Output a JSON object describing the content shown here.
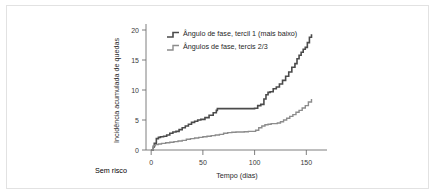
{
  "figure": {
    "caption_left": "Sem risco",
    "border_color": "#e2e2e2",
    "background": "#ffffff"
  },
  "chart_data": {
    "type": "line",
    "subtype": "step",
    "title": "",
    "xlabel": "Tempo (dias)",
    "ylabel": "Incidência acumulada de quedas",
    "xlim": [
      -5,
      170
    ],
    "ylim": [
      0,
      21
    ],
    "xticks": [
      0,
      50,
      100,
      150
    ],
    "yticks": [
      0,
      5,
      10,
      15,
      20
    ],
    "grid": false,
    "legend_position": "top-left",
    "axis_color": "#6f6f6f",
    "series": [
      {
        "name": "Ângulo de fase, tercil 1 (mais baixo)",
        "color": "#4b4b4b",
        "width": 1.6,
        "x": [
          0,
          2,
          3,
          5,
          7,
          9,
          12,
          15,
          18,
          21,
          24,
          27,
          30,
          33,
          36,
          39,
          42,
          45,
          48,
          52,
          56,
          60,
          63,
          64,
          66,
          70,
          78,
          86,
          94,
          100,
          103,
          106,
          109,
          111,
          113,
          115,
          118,
          121,
          124,
          127,
          130,
          133,
          136,
          139,
          141,
          143,
          145,
          147,
          149,
          151,
          153,
          155
        ],
        "y": [
          0.0,
          0.5,
          1.1,
          1.9,
          2.1,
          2.2,
          2.3,
          2.5,
          2.8,
          3.0,
          3.1,
          3.4,
          3.7,
          4.0,
          4.3,
          4.6,
          4.8,
          5.0,
          5.1,
          5.4,
          5.8,
          6.2,
          6.6,
          6.9,
          6.9,
          6.9,
          6.9,
          6.9,
          6.9,
          6.95,
          7.4,
          7.6,
          8.5,
          9.2,
          9.6,
          9.7,
          10.2,
          10.5,
          11.0,
          11.6,
          12.3,
          13.0,
          13.8,
          14.4,
          15.2,
          15.8,
          16.3,
          16.8,
          17.1,
          17.9,
          18.8,
          19.3
        ]
      },
      {
        "name": "Ângulos de fase, tercis 2/3",
        "color": "#8c8c8c",
        "width": 1.4,
        "x": [
          0,
          2,
          4,
          7,
          10,
          14,
          18,
          22,
          26,
          30,
          34,
          38,
          42,
          46,
          50,
          54,
          58,
          62,
          66,
          70,
          74,
          78,
          82,
          86,
          90,
          94,
          98,
          101,
          104,
          107,
          110,
          113,
          116,
          119,
          122,
          125,
          128,
          131,
          134,
          137,
          140,
          143,
          146,
          149,
          152,
          155
        ],
        "y": [
          0.0,
          0.7,
          0.9,
          1.0,
          1.1,
          1.2,
          1.3,
          1.4,
          1.5,
          1.6,
          1.8,
          1.9,
          2.0,
          2.1,
          2.2,
          2.3,
          2.4,
          2.5,
          2.6,
          2.8,
          2.9,
          2.95,
          3.0,
          3.0,
          3.05,
          3.1,
          3.1,
          3.3,
          3.7,
          4.0,
          4.2,
          4.3,
          4.4,
          4.4,
          4.5,
          4.7,
          5.0,
          5.3,
          5.6,
          5.9,
          6.3,
          6.6,
          7.0,
          7.4,
          8.0,
          8.5
        ]
      }
    ]
  }
}
